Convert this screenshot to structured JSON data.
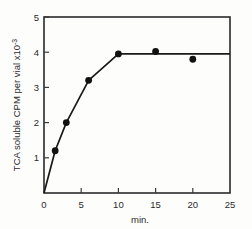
{
  "chart_data": {
    "type": "line",
    "title": "",
    "xlabel": "min.",
    "ylabel": "TCA soluble CPM per vial",
    "ylabel_suffix": "x10",
    "ylabel_exponent": "-3",
    "xlim": [
      0,
      25
    ],
    "ylim": [
      0,
      5
    ],
    "xticks": [
      0,
      5,
      10,
      15,
      20,
      25
    ],
    "xtick_labels": [
      "0",
      "5",
      "10",
      "15",
      "20",
      "25"
    ],
    "yticks": [
      0,
      1,
      2,
      3,
      4,
      5
    ],
    "ytick_labels": [
      "",
      "1",
      "2",
      "3",
      "4",
      "5"
    ],
    "grid": false,
    "legend": "none",
    "marker_style": "filled-circle",
    "series": [
      {
        "name": "TCA soluble CPM",
        "x": [
          0,
          1.5,
          3,
          6,
          10,
          15,
          20,
          25
        ],
        "values": [
          0,
          1.2,
          2.0,
          3.2,
          3.95,
          4.02,
          3.8,
          3.95
        ],
        "markers_shown": [
          false,
          true,
          true,
          true,
          true,
          true,
          true,
          false
        ],
        "line_x": [
          0,
          1.5,
          3,
          6,
          10,
          25
        ],
        "line_values": [
          0,
          1.2,
          2.0,
          3.2,
          3.95,
          3.95
        ]
      }
    ],
    "colors": {
      "line": "#1a1a1a",
      "marker": "#111111",
      "axis": "#2a2a2a",
      "text": "#2b2b2b",
      "background": "#fdfdfc"
    }
  }
}
